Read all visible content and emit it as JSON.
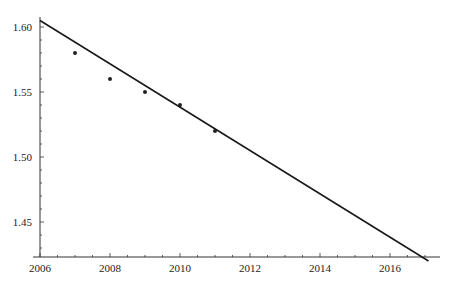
{
  "chart_data": {
    "type": "scatter",
    "title": "",
    "xlabel": "",
    "ylabel": "",
    "xlim": [
      2006,
      2017.2
    ],
    "ylim": [
      1.42,
      1.61
    ],
    "grid": false,
    "legend": null,
    "x_ticks": [
      "2006",
      "2008",
      "2010",
      "2012",
      "2014",
      "2016"
    ],
    "y_ticks": [
      "1.45",
      "1.50",
      "1.55",
      "1.60"
    ],
    "series": [
      {
        "name": "data",
        "kind": "scatter",
        "x": [
          2007,
          2008,
          2009,
          2010,
          2011
        ],
        "y": [
          1.58,
          1.56,
          1.55,
          1.54,
          1.52
        ]
      },
      {
        "name": "linear fit",
        "kind": "line",
        "x": [
          2006,
          2017.1
        ],
        "y": [
          1.605,
          1.42
        ]
      }
    ]
  },
  "colors": {
    "axis": "#333333",
    "line": "#1a1a1a",
    "point": "#222222",
    "background": "#ffffff"
  }
}
